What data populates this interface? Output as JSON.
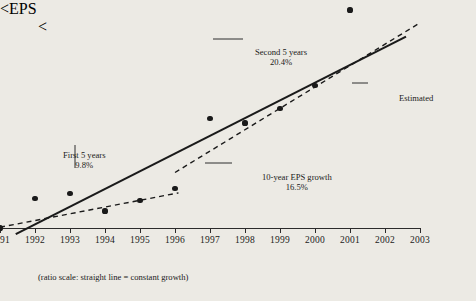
{
  "chart_data": {
    "type": "scatter",
    "title": "",
    "xlabel": "",
    "ylabel": "EPS",
    "x": [
      1991,
      1992,
      1993,
      1994,
      1995,
      1996,
      1997,
      1998,
      1999,
      2000,
      2001
    ],
    "values": [
      1.0,
      1.22,
      1.26,
      1.12,
      1.2,
      1.3,
      2.08,
      2.02,
      2.22,
      2.6,
      4.3
    ],
    "xlim": [
      1991,
      2003
    ],
    "ylim": [
      1.0,
      4.6
    ],
    "yticks": [
      "4.00",
      "2.00",
      "1.00"
    ],
    "ytick_values": [
      4.0,
      2.0,
      1.0
    ],
    "xticks": [
      "1991",
      "1992",
      "1993",
      "1994",
      "1995",
      "1996",
      "1997",
      "1998",
      "1999",
      "2000",
      "2001",
      "2002",
      "2003"
    ],
    "scale": "ratio",
    "grid": false,
    "legend": false,
    "series": [
      {
        "name": "10-year EPS growth trend",
        "style": "solid",
        "x": [
          1991.45,
          2002.6
        ],
        "values": [
          0.96,
          3.6
        ]
      },
      {
        "name": "First 5 years fit",
        "style": "dashed",
        "x": [
          1991.0,
          1996.1
        ],
        "values": [
          1.005,
          1.265
        ]
      },
      {
        "name": "Second 5 years fit",
        "style": "dashed",
        "x": [
          1996.0,
          2002.95
        ],
        "values": [
          1.45,
          3.92
        ]
      }
    ],
    "annotations": {
      "second_five": {
        "line1": "Second 5 years",
        "line2": "20.4%"
      },
      "first_five": {
        "line1": "First 5 years",
        "line2": "9.8%"
      },
      "ten_year": {
        "line1": "10-year EPS growth",
        "line2": "16.5%"
      },
      "estimated": {
        "label": "Estimated"
      }
    },
    "footnote": "(ratio scale: straight line = constant growth)"
  }
}
